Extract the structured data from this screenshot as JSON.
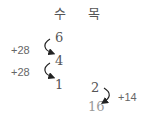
{
  "headers": {
    "left": "수",
    "right": "목"
  },
  "left_column": {
    "values": [
      "6",
      "4",
      "1"
    ],
    "steps": [
      "+28",
      "+28"
    ]
  },
  "right_column": {
    "values": [
      "2",
      "16"
    ],
    "steps": [
      "+14"
    ]
  },
  "colors": {
    "text": "#555555",
    "muted_text": "#999999",
    "arrow": "#222222"
  }
}
